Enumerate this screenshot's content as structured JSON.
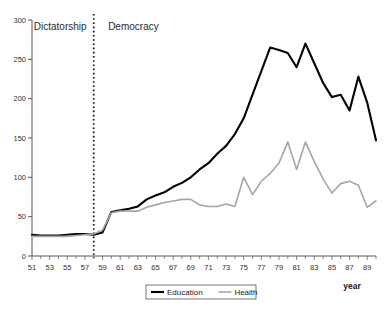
{
  "chart_data": {
    "type": "line",
    "title": "",
    "xlabel": "year",
    "ylabel": "",
    "ylim": [
      0,
      300
    ],
    "xlim": [
      51,
      90
    ],
    "grid": false,
    "legend_position": "bottom-center",
    "y_ticks": [
      0,
      50,
      100,
      150,
      200,
      250,
      300
    ],
    "x_ticks": [
      51,
      53,
      55,
      57,
      59,
      61,
      63,
      65,
      67,
      69,
      71,
      73,
      75,
      77,
      79,
      81,
      83,
      85,
      87,
      89
    ],
    "x": [
      51,
      52,
      53,
      54,
      55,
      56,
      57,
      58,
      59,
      60,
      61,
      62,
      63,
      64,
      65,
      66,
      67,
      68,
      69,
      70,
      71,
      72,
      73,
      74,
      75,
      76,
      77,
      78,
      79,
      80,
      81,
      82,
      83,
      84,
      85,
      86,
      87,
      88,
      89,
      90
    ],
    "series": [
      {
        "name": "Education",
        "color": "#000000",
        "width": 2.1,
        "values": [
          27,
          26,
          26,
          26,
          27,
          28,
          28,
          27,
          30,
          56,
          58,
          60,
          63,
          72,
          77,
          81,
          88,
          93,
          100,
          110,
          118,
          130,
          140,
          155,
          175,
          205,
          235,
          265,
          262,
          258,
          240,
          270,
          245,
          220,
          202,
          205,
          185,
          228,
          195,
          147
        ]
      },
      {
        "name": "Health",
        "color": "#a6a6a6",
        "width": 1.6,
        "values": [
          25,
          25,
          25,
          25,
          25,
          26,
          27,
          28,
          33,
          55,
          57,
          57,
          57,
          62,
          65,
          68,
          70,
          72,
          72,
          65,
          63,
          63,
          66,
          63,
          100,
          78,
          95,
          105,
          118,
          145,
          110,
          145,
          120,
          98,
          80,
          92,
          95,
          90,
          62,
          70
        ]
      }
    ],
    "annotations": [
      {
        "name": "dictatorship-label",
        "text": "Dictatorship",
        "x": 54.2,
        "y": 287
      },
      {
        "name": "democracy-label",
        "text": "Democracy",
        "x": 62.5,
        "y": 287
      }
    ],
    "divider": {
      "name": "regime-divider",
      "x": 58,
      "style": "dotted"
    }
  },
  "legend": {
    "items": [
      {
        "label": "Education",
        "color": "#000000"
      },
      {
        "label": "Health",
        "color": "#a6a6a6"
      }
    ]
  },
  "axis": {
    "x_title": "year"
  }
}
